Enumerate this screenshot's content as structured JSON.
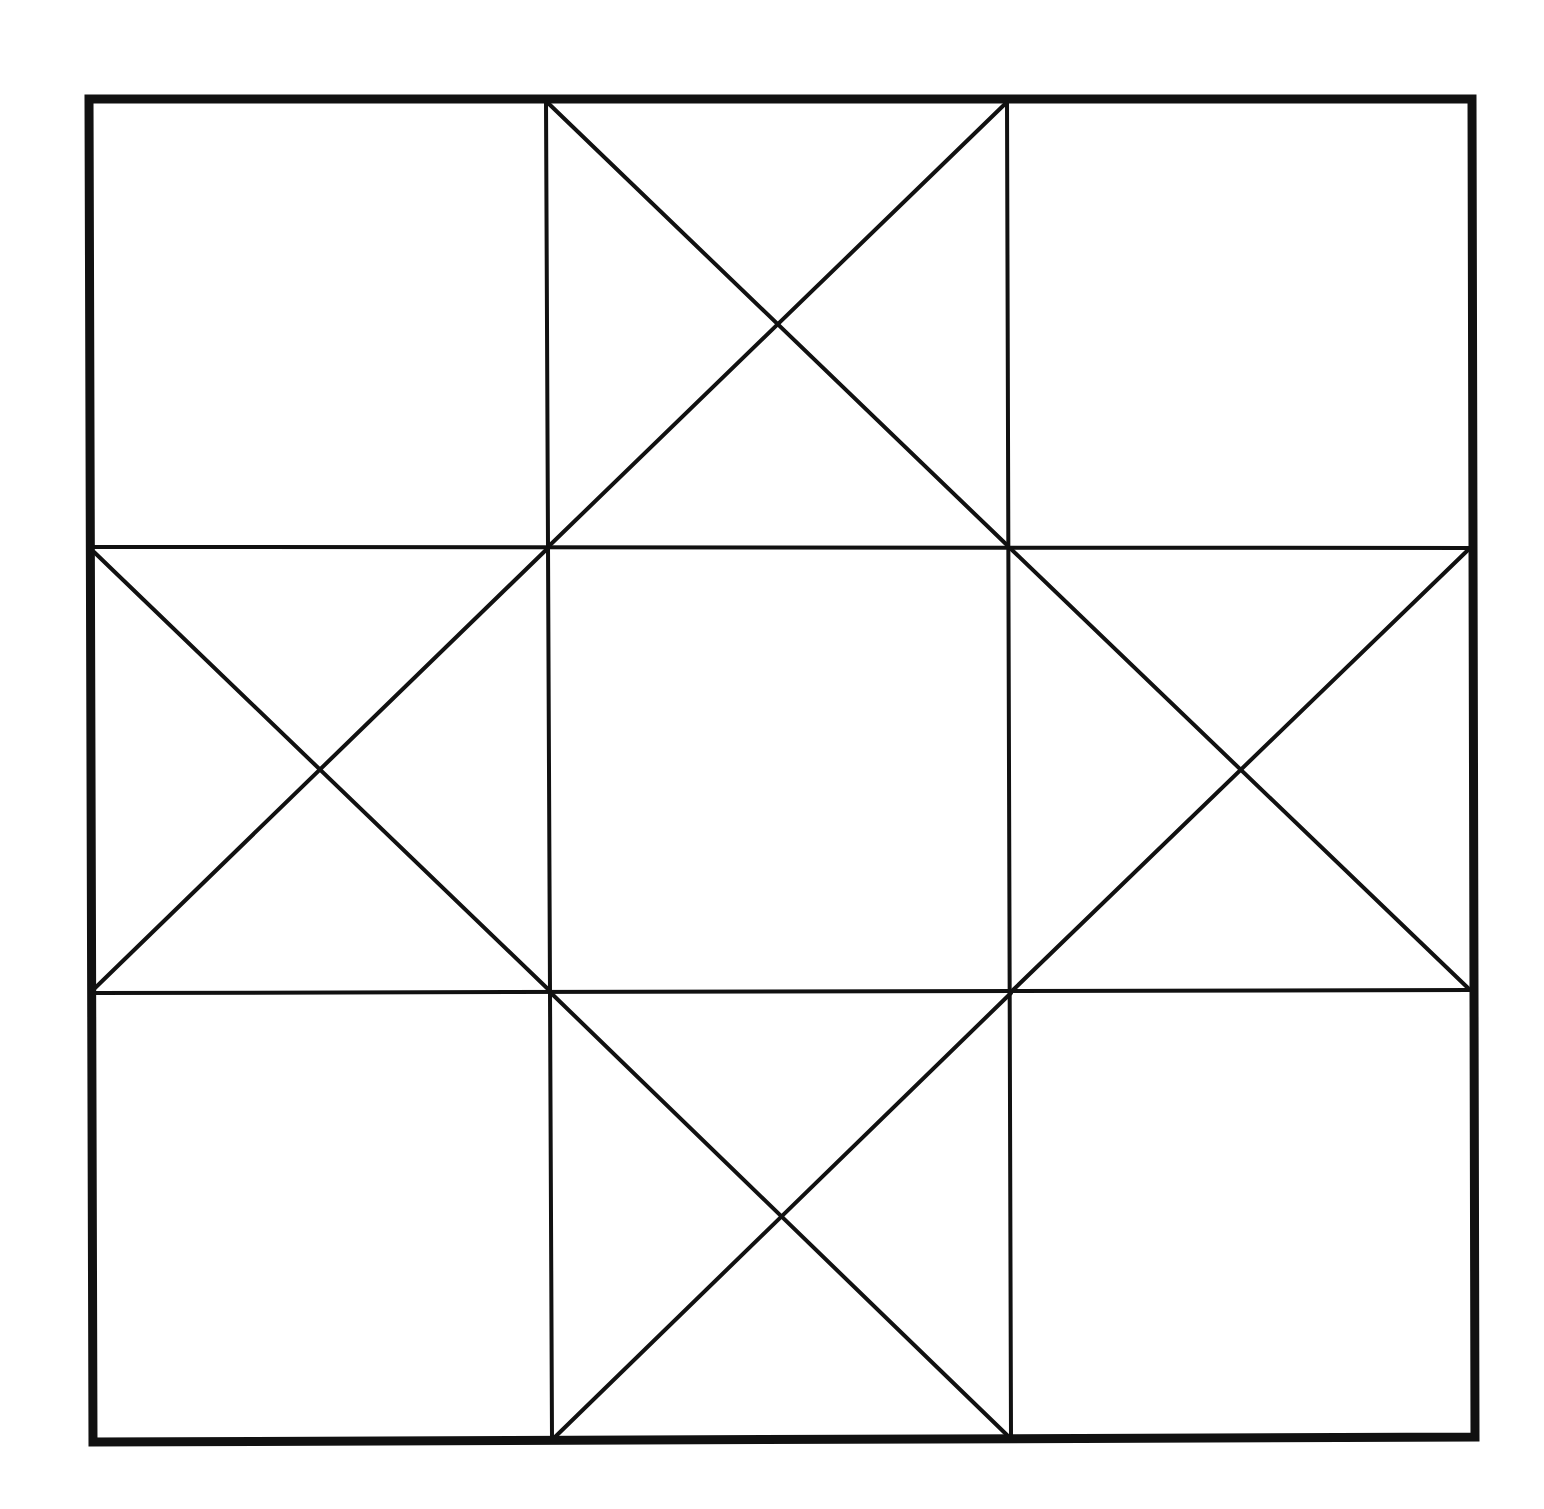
{
  "diagram": {
    "type": "quilt-block-line-drawing",
    "canvas": {
      "width": 1544,
      "height": 1509,
      "background": "#ffffff"
    },
    "stroke_color": "#111111",
    "outer_border": {
      "points": [
        [
          89,
          99
        ],
        [
          1472,
          99
        ],
        [
          1475,
          1437
        ],
        [
          93,
          1442
        ]
      ],
      "stroke_width": 9
    },
    "grid": {
      "rows": 3,
      "cols": 3,
      "stroke_width": 4,
      "lines": [
        {
          "name": "vertical-line-1",
          "x1": 546,
          "y1": 101,
          "x2": 552,
          "y2": 1438
        },
        {
          "name": "vertical-line-2",
          "x1": 1007,
          "y1": 101,
          "x2": 1011,
          "y2": 1436
        },
        {
          "name": "horizontal-line-1",
          "x1": 94,
          "y1": 547,
          "x2": 1468,
          "y2": 548
        },
        {
          "name": "horizontal-line-2",
          "x1": 94,
          "y1": 993,
          "x2": 1470,
          "y2": 990
        }
      ]
    },
    "star_points": {
      "stroke_width": 4,
      "cells": [
        {
          "name": "top-middle-x",
          "center": [
            777,
            324
          ],
          "lines": [
            [
              548,
              103,
              1008,
              546
            ],
            [
              1006,
              103,
              549,
              546
            ]
          ]
        },
        {
          "name": "middle-left-x",
          "center": [
            318,
            769
          ],
          "lines": [
            [
              94,
              552,
              550,
              991
            ],
            [
              548,
              548,
              94,
              989
            ]
          ]
        },
        {
          "name": "middle-right-x",
          "center": [
            1240,
            769
          ],
          "lines": [
            [
              1011,
              549,
              1468,
              988
            ],
            [
              1468,
              550,
              1013,
              990
            ]
          ]
        },
        {
          "name": "bottom-middle-x",
          "center": [
            781,
            1215
          ],
          "lines": [
            [
              551,
              993,
              1007,
              1435
            ],
            [
              1011,
              993,
              555,
              1437
            ]
          ]
        }
      ]
    },
    "empty_cells": [
      "top-left",
      "top-right",
      "center",
      "bottom-left",
      "bottom-right"
    ]
  }
}
